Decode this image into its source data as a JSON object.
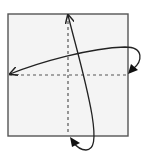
{
  "diagram": {
    "type": "origami-fold-diagram",
    "colors": {
      "paper_fill": "#f4f4f4",
      "paper_border": "#555555",
      "crease": "#555555",
      "arrow": "#222222",
      "background": "#ffffff"
    },
    "paper": {
      "x": 8,
      "y": 14,
      "width": 120,
      "height": 122
    },
    "creases": [
      {
        "name": "vertical-valley-fold",
        "x1": 68,
        "y1": 14,
        "x2": 68,
        "y2": 136,
        "style": "dashed"
      },
      {
        "name": "horizontal-valley-fold",
        "x1": 8,
        "y1": 75,
        "x2": 128,
        "y2": 75,
        "style": "dashed"
      }
    ],
    "arrows": [
      {
        "name": "fold-right-to-left-arrow",
        "direction": "right edge folds over to left edge"
      },
      {
        "name": "fold-bottom-to-top-arrow",
        "direction": "bottom edge folds up to top edge"
      }
    ]
  }
}
